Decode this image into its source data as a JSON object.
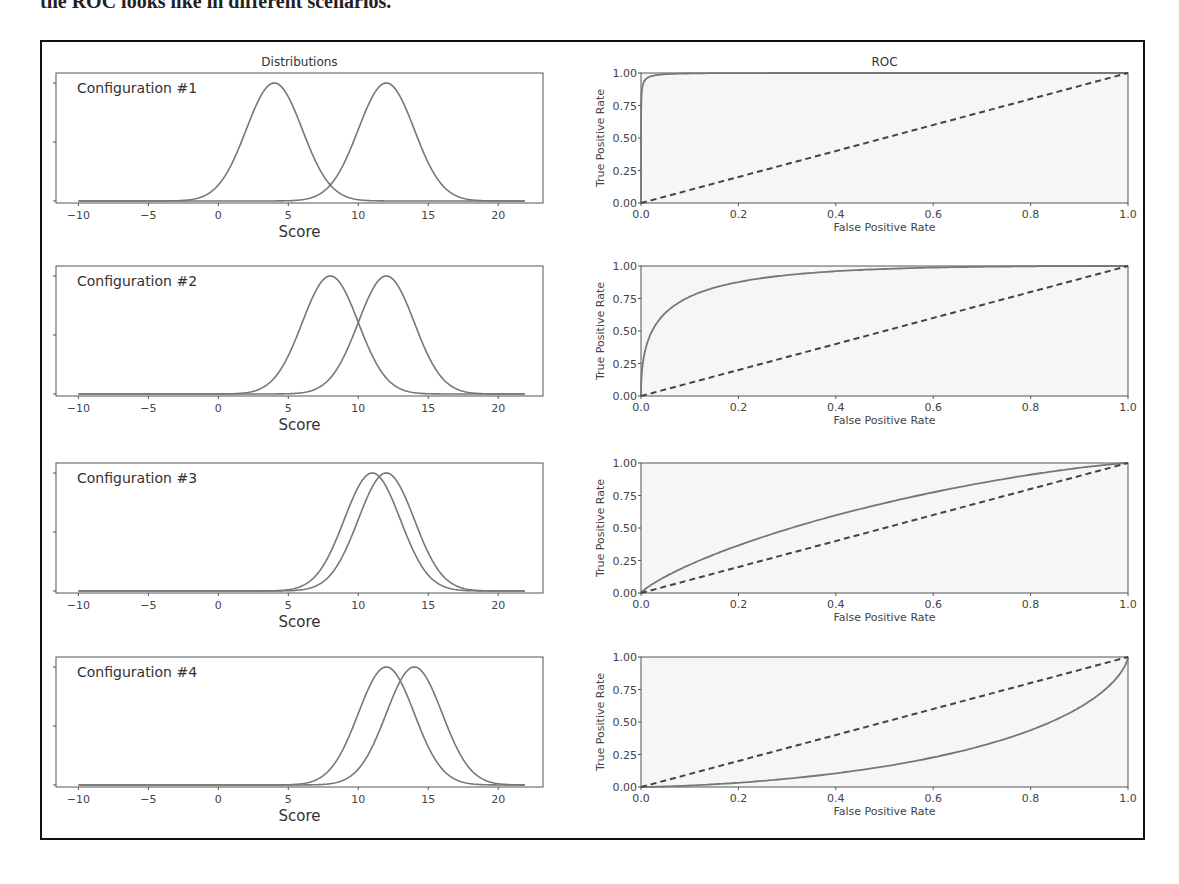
{
  "page": {
    "cut_text": "the ROC looks like in different scenarios."
  },
  "figure": {
    "left_column_title": "Distributions",
    "right_column_title": "ROC",
    "dist_xlabel": "Score",
    "roc_xlabel": "False Positive Rate",
    "roc_ylabel": "True Positive Rate",
    "dist_xticks": [
      -10,
      -5,
      0,
      5,
      10,
      15,
      20
    ],
    "roc_xticks": [
      "0.0",
      "0.2",
      "0.4",
      "0.6",
      "0.8",
      "1.0"
    ],
    "roc_yticks": [
      "0.00",
      "0.25",
      "0.50",
      "0.75",
      "1.00"
    ],
    "colors": {
      "curve": "#777777",
      "diagonal": "#444444",
      "axis": "#555555",
      "frame": "#111111"
    }
  },
  "chart_data": [
    {
      "type": "line",
      "title": "Distributions",
      "label": "Configuration #1",
      "xlabel": "Score",
      "xlim": [
        -11.6,
        23.2
      ],
      "series": [
        {
          "name": "negative",
          "mean": 4,
          "sd": 2
        },
        {
          "name": "positive",
          "mean": 12,
          "sd": 2
        }
      ]
    },
    {
      "type": "line",
      "title": "ROC",
      "label": "Configuration #1",
      "xlabel": "False Positive Rate",
      "ylabel": "True Positive Rate",
      "xlim": [
        0,
        1
      ],
      "ylim": [
        0,
        1
      ],
      "auc_approx": 0.998,
      "diagonal": true
    },
    {
      "type": "line",
      "label": "Configuration #2",
      "xlabel": "Score",
      "xlim": [
        -11.6,
        23.2
      ],
      "series": [
        {
          "name": "negative",
          "mean": 8,
          "sd": 2
        },
        {
          "name": "positive",
          "mean": 12,
          "sd": 2
        }
      ]
    },
    {
      "type": "line",
      "label": "Configuration #2 ROC",
      "xlabel": "False Positive Rate",
      "ylabel": "True Positive Rate",
      "xlim": [
        0,
        1
      ],
      "ylim": [
        0,
        1
      ],
      "auc_approx": 0.92,
      "diagonal": true
    },
    {
      "type": "line",
      "label": "Configuration #3",
      "xlabel": "Score",
      "xlim": [
        -11.6,
        23.2
      ],
      "series": [
        {
          "name": "negative",
          "mean": 11,
          "sd": 2
        },
        {
          "name": "positive",
          "mean": 12,
          "sd": 2
        }
      ]
    },
    {
      "type": "line",
      "label": "Configuration #3 ROC",
      "xlabel": "False Positive Rate",
      "ylabel": "True Positive Rate",
      "xlim": [
        0,
        1
      ],
      "ylim": [
        0,
        1
      ],
      "auc_approx": 0.64,
      "diagonal": true
    },
    {
      "type": "line",
      "label": "Configuration #4",
      "xlabel": "Score",
      "xlim": [
        -11.6,
        23.2
      ],
      "series": [
        {
          "name": "negative",
          "mean": 14,
          "sd": 2
        },
        {
          "name": "positive",
          "mean": 12,
          "sd": 2
        }
      ]
    },
    {
      "type": "line",
      "label": "Configuration #4 ROC",
      "xlabel": "False Positive Rate",
      "ylabel": "True Positive Rate",
      "xlim": [
        0,
        1
      ],
      "ylim": [
        0,
        1
      ],
      "auc_approx": 0.24,
      "diagonal": true
    }
  ],
  "rows": [
    {
      "label": "Configuration #1",
      "neg_mean": 4,
      "pos_mean": 12
    },
    {
      "label": "Configuration #2",
      "neg_mean": 8,
      "pos_mean": 12
    },
    {
      "label": "Configuration #3",
      "neg_mean": 11,
      "pos_mean": 12
    },
    {
      "label": "Configuration #4",
      "neg_mean": 14,
      "pos_mean": 12
    }
  ]
}
